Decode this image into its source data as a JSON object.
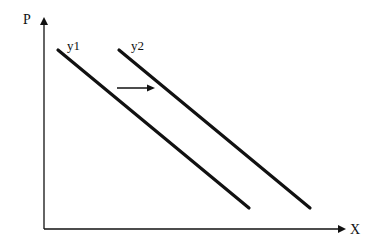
{
  "diagram": {
    "type": "shift-diagram",
    "axes": {
      "y_label": "P",
      "x_label": "X",
      "origin": [
        44,
        229
      ],
      "y_top": [
        44,
        17
      ],
      "x_right": [
        346,
        229
      ]
    },
    "curves": [
      {
        "name": "y1",
        "label": "y1",
        "start": [
          58,
          50
        ],
        "end": [
          249,
          208
        ],
        "label_pos": [
          68,
          50
        ]
      },
      {
        "name": "y2",
        "label": "y2",
        "start": [
          119,
          50
        ],
        "end": [
          310,
          208
        ],
        "label_pos": [
          131,
          50
        ]
      }
    ],
    "shift_arrow": {
      "from": [
        117,
        88
      ],
      "to": [
        155,
        88
      ],
      "direction": "right"
    },
    "colors": {
      "line": "#111111",
      "background": "#ffffff"
    }
  }
}
